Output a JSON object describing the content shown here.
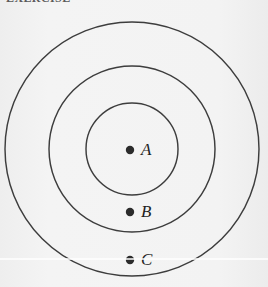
{
  "figure": {
    "background_color": "#f2f2f2",
    "stroke_color": "#3d3d3d",
    "dot_color": "#2b2b2b",
    "clipped_caption": "EXERCISE",
    "center": {
      "x": 132,
      "y": 149
    },
    "circles": [
      {
        "name": "inner-circle",
        "radius": 46,
        "stroke_width": 1.45
      },
      {
        "name": "middle-circle",
        "radius": 83,
        "stroke_width": 1.45
      },
      {
        "name": "outer-circle",
        "radius": 127,
        "stroke_width": 1.5
      }
    ],
    "points": [
      {
        "label": "A",
        "x": 130,
        "y": 150,
        "dot_radius": 4.2,
        "region": "inner-circle",
        "label_offset_x": 11,
        "label_offset_y": -9
      },
      {
        "label": "B",
        "x": 130,
        "y": 212,
        "dot_radius": 4.2,
        "region": "middle-annulus",
        "label_offset_x": 11,
        "label_offset_y": -9
      },
      {
        "label": "C",
        "x": 130,
        "y": 260,
        "dot_radius": 4.2,
        "region": "outer-annulus",
        "label_offset_x": 11,
        "label_offset_y": -9
      }
    ],
    "artifacts": [
      {
        "name": "scan-line",
        "y": 258
      }
    ]
  }
}
